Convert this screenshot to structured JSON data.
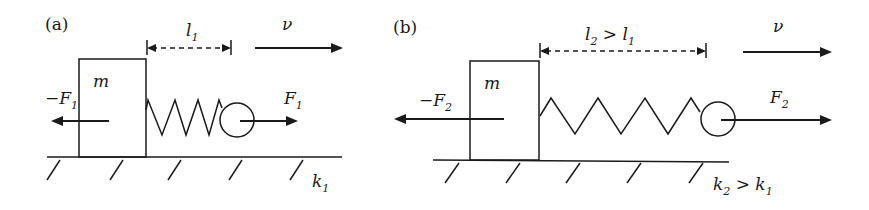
{
  "panels": [
    {
      "id": "a",
      "label": "(a)",
      "mass_label": "m",
      "length_label": "l",
      "length_sub": "1",
      "length_extra": "",
      "length_extra_sub": "",
      "velocity_label": "ν",
      "left_force_label": "−F",
      "left_force_sub": "1",
      "right_force_label": "F",
      "right_force_sub": "1",
      "stiffness_label": "k",
      "stiffness_sub": "1",
      "stiffness_extra": "",
      "stiffness_extra_sub": ""
    },
    {
      "id": "b",
      "label": "(b)",
      "mass_label": "m",
      "length_label": "l",
      "length_sub": "2",
      "length_extra": " > l",
      "length_extra_sub": "1",
      "velocity_label": "ν",
      "left_force_label": "−F",
      "left_force_sub": "2",
      "right_force_label": "F",
      "right_force_sub": "2",
      "stiffness_label": "k",
      "stiffness_sub": "2",
      "stiffness_extra": " > k",
      "stiffness_extra_sub": "1"
    }
  ]
}
